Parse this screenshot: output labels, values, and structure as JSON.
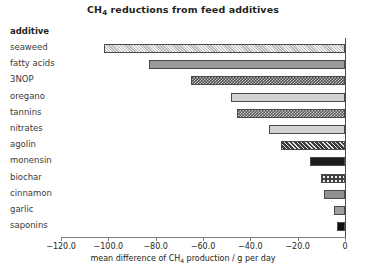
{
  "chart_data": {
    "type": "bar",
    "orientation": "horizontal",
    "title": "CH4 reductions from feed additives",
    "title_prefix": "CH",
    "title_sub": "4",
    "title_rest": " reductions from feed additives",
    "group_header": "additive",
    "xlabel_prefix": "mean difference of CH",
    "xlabel_sub": "4",
    "xlabel_rest": " production / g per day",
    "xlabel": "mean difference of CH4 production / g per day",
    "ylabel": "additive",
    "xlim": [
      -120.0,
      0.0
    ],
    "grid": false,
    "legend": "none",
    "tick_labels": [
      "−120.0",
      "−100.0",
      "−80.0",
      "−60.0",
      "−40.0",
      "−20.0",
      "0"
    ],
    "ticks": [
      -120,
      -100,
      -80,
      -60,
      -40,
      -20,
      0
    ],
    "categories": [
      "seaweed",
      "fatty acids",
      "3NOP",
      "oregano",
      "tannins",
      "nitrates",
      "agolin",
      "monensin",
      "biochar",
      "cinnamon",
      "garlic",
      "saponins"
    ],
    "values": [
      -102.0,
      -83.0,
      -65.0,
      -48.0,
      -45.5,
      -32.0,
      -27.0,
      -15.0,
      -10.0,
      -9.0,
      -4.5,
      -3.5
    ],
    "bars": [
      {
        "label": "seaweed",
        "value": -102.0,
        "pattern": "fine-hatch"
      },
      {
        "label": "fatty acids",
        "value": -83.0,
        "pattern": "solid-mid"
      },
      {
        "label": "3NOP",
        "value": -65.0,
        "pattern": "checker"
      },
      {
        "label": "oregano",
        "value": -48.0,
        "pattern": "light"
      },
      {
        "label": "tannins",
        "value": -45.5,
        "pattern": "checker2"
      },
      {
        "label": "nitrates",
        "value": -32.0,
        "pattern": "light"
      },
      {
        "label": "agolin",
        "value": -27.0,
        "pattern": "diag-dark"
      },
      {
        "label": "monensin",
        "value": -15.0,
        "pattern": "solid-dark"
      },
      {
        "label": "biochar",
        "value": -10.0,
        "pattern": "dots"
      },
      {
        "label": "cinnamon",
        "value": -9.0,
        "pattern": "solid-light"
      },
      {
        "label": "garlic",
        "value": -4.5,
        "pattern": "box-light"
      },
      {
        "label": "saponins",
        "value": -3.5,
        "pattern": "black"
      }
    ],
    "colors": {
      "axis": "#4d4d4d",
      "text": "#231f20",
      "label": "#3a3a3a",
      "background": "#ffffff"
    }
  }
}
